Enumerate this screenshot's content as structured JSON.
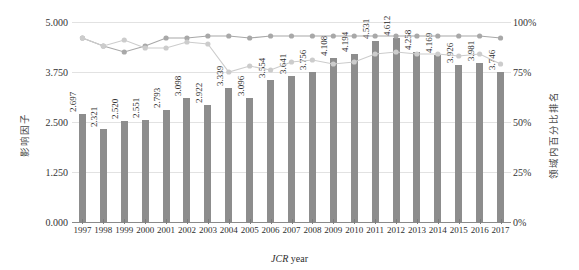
{
  "chart_data": {
    "type": "bar",
    "title": "",
    "xlabel_prefix": "JCR",
    "xlabel_suffix": "year",
    "ylabel": "影响因子",
    "ylabel_right": "领域内百分比排名",
    "categories": [
      "1997",
      "1998",
      "1999",
      "2000",
      "2001",
      "2002",
      "2003",
      "2004",
      "2005",
      "2006",
      "2007",
      "2008",
      "2009",
      "2010",
      "2011",
      "2012",
      "2013",
      "2014",
      "2015",
      "2016",
      "2017"
    ],
    "values": [
      2.697,
      2.321,
      2.52,
      2.551,
      2.793,
      3.098,
      2.922,
      3.339,
      3.096,
      3.554,
      3.641,
      3.756,
      4.108,
      4.194,
      4.531,
      4.612,
      4.258,
      4.169,
      3.926,
      3.981,
      3.746
    ],
    "value_labels": [
      "2.697",
      "2.321",
      "2.520",
      "2.551",
      "2.793",
      "3.098",
      "2.922",
      "3.339",
      "3.096",
      "3.554",
      "3.641",
      "3.756",
      "4.108",
      "4.194",
      "4.531",
      "4.612",
      "4.258",
      "4.169",
      "3.926",
      "3.981",
      "3.746"
    ],
    "ylim": [
      0,
      5
    ],
    "yticks": [
      0,
      1.25,
      2.5,
      3.75,
      5
    ],
    "ytick_labels": [
      "0.000",
      "1.250",
      "2.500",
      "3.750",
      "5.000"
    ],
    "ylim_right": [
      0,
      100
    ],
    "yticks_right": [
      0,
      25,
      50,
      75,
      100
    ],
    "ytick_labels_right": [
      "0%",
      "25%",
      "50%",
      "75%",
      "100%"
    ],
    "grid": true,
    "legend": "none",
    "series": [
      {
        "name": "percentile-line-upper",
        "axis": "right",
        "color": "#a8a8a8",
        "marker": "circle",
        "values": [
          92,
          88,
          85,
          88,
          92,
          92,
          93,
          93,
          92,
          93,
          93,
          93,
          93,
          93,
          93,
          93,
          93,
          93,
          93,
          93,
          92
        ]
      },
      {
        "name": "percentile-line-lower",
        "axis": "right",
        "color": "#cccccc",
        "marker": "circle",
        "values": [
          92,
          88,
          91,
          87,
          87,
          90,
          89,
          75,
          78,
          76,
          80,
          81,
          79,
          80,
          84,
          85,
          84,
          84,
          83,
          84,
          79
        ]
      }
    ]
  }
}
